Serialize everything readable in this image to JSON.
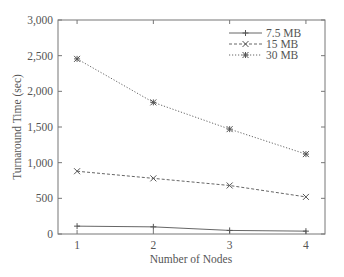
{
  "chart_data": {
    "type": "line",
    "title": "",
    "xlabel": "Number of Nodes",
    "ylabel": "Turnaround Time (sec)",
    "x": [
      1,
      2,
      3,
      4
    ],
    "xticks": [
      "1",
      "2",
      "3",
      "4"
    ],
    "yticks": [
      "0",
      "500",
      "1,000",
      "1,500",
      "2,000",
      "2,500",
      "3,000"
    ],
    "ylim": [
      0,
      3000
    ],
    "xlim": [
      0.75,
      4.25
    ],
    "grid": false,
    "legend_position": "upper right",
    "series": [
      {
        "name": "7.5 MB",
        "marker": "plus",
        "line": "solid",
        "values": [
          110,
          100,
          50,
          40
        ]
      },
      {
        "name": "15 MB",
        "marker": "x",
        "line": "dashed",
        "values": [
          880,
          780,
          680,
          520
        ]
      },
      {
        "name": "30 MB",
        "marker": "star",
        "line": "dotted",
        "values": [
          2455,
          1845,
          1470,
          1120
        ]
      }
    ]
  },
  "colors": {
    "axis": "#777777",
    "series_line": "#555555",
    "text": "#555555"
  }
}
